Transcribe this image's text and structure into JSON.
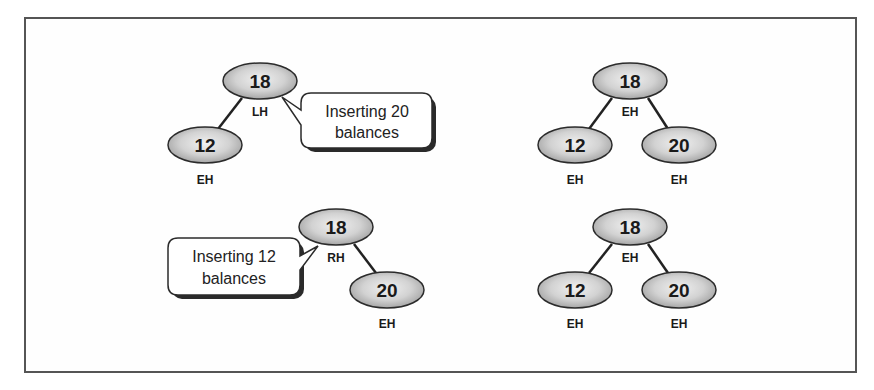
{
  "figure": {
    "panels": [
      {
        "id": "top-left",
        "description": "Left-high tree before insertion",
        "nodes": [
          {
            "key": "18",
            "balance": "LH",
            "cx": 260,
            "cy": 81
          },
          {
            "key": "12",
            "balance": "EH",
            "cx": 205,
            "cy": 145
          }
        ],
        "callout": {
          "line1": "Inserting 20",
          "line2": "balances"
        }
      },
      {
        "id": "top-right",
        "description": "Balanced tree after inserting 20",
        "nodes": [
          {
            "key": "18",
            "balance": "EH",
            "cx": 630,
            "cy": 81
          },
          {
            "key": "12",
            "balance": "EH",
            "cx": 575,
            "cy": 145
          },
          {
            "key": "20",
            "balance": "EH",
            "cx": 679,
            "cy": 145
          }
        ]
      },
      {
        "id": "bottom-left",
        "description": "Right-high tree before insertion",
        "nodes": [
          {
            "key": "18",
            "balance": "RH",
            "cx": 336,
            "cy": 227
          },
          {
            "key": "20",
            "balance": "EH",
            "cx": 387,
            "cy": 290
          }
        ],
        "callout": {
          "line1": "Inserting 12",
          "line2": "balances"
        }
      },
      {
        "id": "bottom-right",
        "description": "Balanced tree after inserting 12",
        "nodes": [
          {
            "key": "18",
            "balance": "EH",
            "cx": 630,
            "cy": 227
          },
          {
            "key": "12",
            "balance": "EH",
            "cx": 575,
            "cy": 290
          },
          {
            "key": "20",
            "balance": "EH",
            "cx": 679,
            "cy": 290
          }
        ]
      }
    ]
  },
  "colors": {
    "node_fill_center": "#ececec",
    "node_fill_edge": "#a9a9a9",
    "outline": "#2b2b2b",
    "frame": "#555555"
  }
}
